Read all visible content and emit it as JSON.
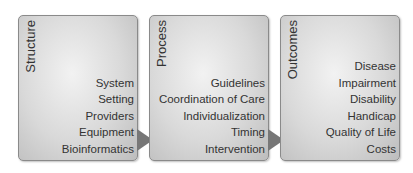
{
  "diagram": {
    "type": "flow",
    "boxes": [
      {
        "title": "Structure",
        "items": [
          "System",
          "Setting",
          "Providers",
          "Equipment",
          "Bioinformatics"
        ]
      },
      {
        "title": "Process",
        "items": [
          "Guidelines",
          "Coordination of Care",
          "Individualization",
          "Timing",
          "Intervention"
        ]
      },
      {
        "title": "Outcomes",
        "items": [
          "Disease",
          "Impairment",
          "Disability",
          "Handicap",
          "Quality of Life",
          "Costs"
        ]
      }
    ],
    "connections": [
      {
        "from": "Structure",
        "to": "Process"
      },
      {
        "from": "Process",
        "to": "Outcomes"
      }
    ]
  }
}
